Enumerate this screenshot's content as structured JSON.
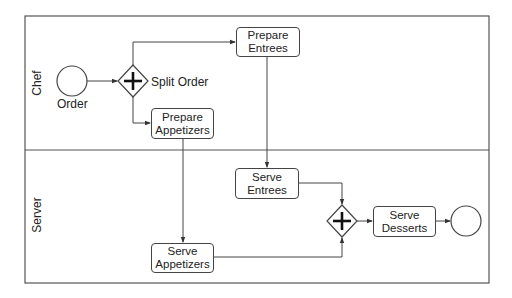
{
  "diagram": {
    "type": "bpmn-process",
    "pool": {
      "lanes": [
        {
          "id": "chef",
          "label": "Chef"
        },
        {
          "id": "server",
          "label": "Server"
        }
      ]
    },
    "events": {
      "start": {
        "label": "Order"
      },
      "end": {
        "label": ""
      }
    },
    "gateways": {
      "split": {
        "label": "Split Order",
        "kind": "parallel"
      },
      "join": {
        "label": "",
        "kind": "parallel"
      }
    },
    "tasks": {
      "prepare_entrees": {
        "line1": "Prepare",
        "line2": "Entrees",
        "lane": "Chef"
      },
      "prepare_appetizers": {
        "line1": "Prepare",
        "line2": "Appetizers",
        "lane": "Chef"
      },
      "serve_entrees": {
        "line1": "Serve",
        "line2": "Entrees",
        "lane": "Server"
      },
      "serve_appetizers": {
        "line1": "Serve",
        "line2": "Appetizers",
        "lane": "Server"
      },
      "serve_desserts": {
        "line1": "Serve",
        "line2": "Desserts",
        "lane": "Server"
      }
    },
    "flows": [
      [
        "Order",
        "Split Order"
      ],
      [
        "Split Order",
        "Prepare Entrees"
      ],
      [
        "Split Order",
        "Prepare Appetizers"
      ],
      [
        "Prepare Entrees",
        "Serve Entrees"
      ],
      [
        "Prepare Appetizers",
        "Serve Appetizers"
      ],
      [
        "Serve Entrees",
        "Join Gateway"
      ],
      [
        "Serve Appetizers",
        "Join Gateway"
      ],
      [
        "Join Gateway",
        "Serve Desserts"
      ],
      [
        "Serve Desserts",
        "End"
      ]
    ],
    "colors": {
      "stroke": "#444444",
      "text": "#222222",
      "background": "#ffffff"
    }
  }
}
